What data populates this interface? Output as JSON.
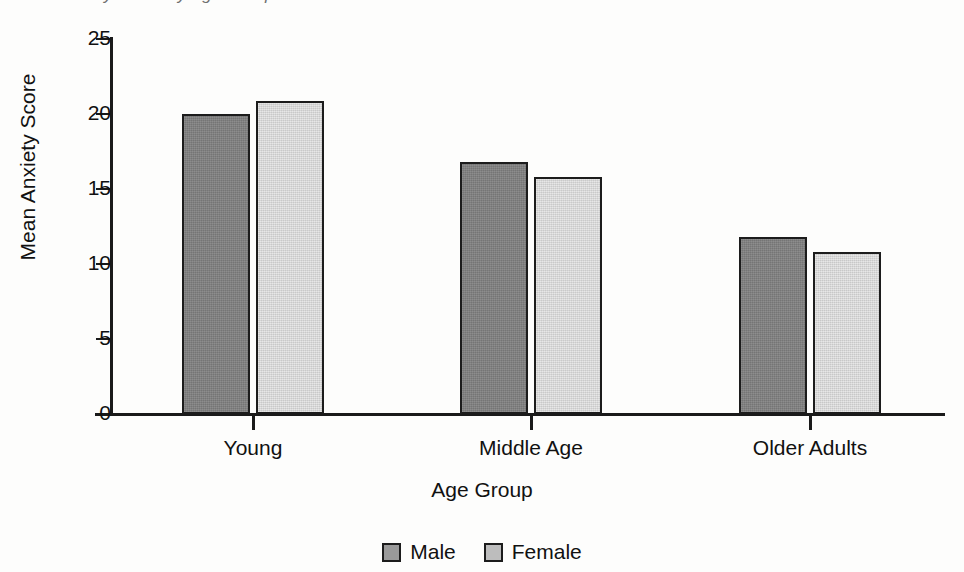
{
  "chart_data": {
    "type": "bar",
    "title": "Mean Anxiety Score by Age Group",
    "xlabel": "Age Group",
    "ylabel": "Mean Anxiety Score",
    "categories": [
      "Young",
      "Middle Age",
      "Older Adults"
    ],
    "series": [
      {
        "name": "Male",
        "color": "#808080",
        "values": [
          20.0,
          16.8,
          11.8
        ]
      },
      {
        "name": "Female",
        "color": "#dcdcdc",
        "values": [
          20.9,
          15.8,
          10.8
        ]
      }
    ],
    "ylim": [
      0,
      25
    ],
    "yticks": [
      0,
      5,
      10,
      15,
      20,
      25
    ],
    "ytick_labels": [
      "0",
      "5",
      "10",
      "15",
      "20",
      "25"
    ],
    "grid": false,
    "legend_position": "bottom"
  },
  "legend": {
    "items": [
      {
        "label": "Male"
      },
      {
        "label": "Female"
      }
    ]
  }
}
